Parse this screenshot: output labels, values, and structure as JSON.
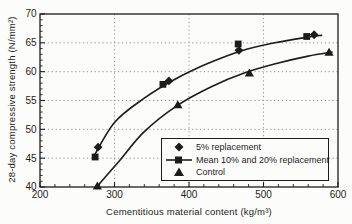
{
  "chart_data": {
    "type": "scatter",
    "title": "",
    "xlabel": "Cementitious material content (kg/m³)",
    "ylabel": "28-day compressive strength (N/mm²)",
    "xlim": [
      200,
      600
    ],
    "ylim": [
      40,
      70
    ],
    "x_ticks": [
      200,
      300,
      400,
      500,
      600
    ],
    "y_ticks": [
      40,
      45,
      50,
      55,
      60,
      65,
      70
    ],
    "x_minor_step": 20,
    "y_minor_step": 1,
    "grid": "dotted",
    "legend_position": "inside-bottom-right",
    "series": [
      {
        "name": "5% replacement",
        "marker": "diamond",
        "points": [
          [
            278,
            46.9
          ],
          [
            373,
            58.4
          ],
          [
            467,
            63.7
          ],
          [
            568,
            66.4
          ]
        ]
      },
      {
        "name": "Mean 10% and 20% replacement",
        "marker": "square",
        "legend_line": true,
        "points": [
          [
            274,
            45.2
          ],
          [
            365,
            57.8
          ],
          [
            466,
            64.8
          ],
          [
            558,
            66.1
          ]
        ]
      },
      {
        "name": "Control",
        "marker": "triangle",
        "points": [
          [
            277,
            40.2
          ],
          [
            385,
            54.3
          ],
          [
            481,
            59.8
          ],
          [
            588,
            63.4
          ]
        ]
      }
    ],
    "fit_curves": [
      {
        "name": "replacement-mean-fit",
        "points": [
          [
            271,
            45.0
          ],
          [
            300,
            51.2
          ],
          [
            340,
            55.4
          ],
          [
            380,
            58.6
          ],
          [
            425,
            61.4
          ],
          [
            470,
            63.6
          ],
          [
            515,
            65.0
          ],
          [
            560,
            66.0
          ],
          [
            578,
            66.3
          ]
        ]
      },
      {
        "name": "control-fit",
        "points": [
          [
            276,
            40.0
          ],
          [
            305,
            44.3
          ],
          [
            340,
            49.6
          ],
          [
            385,
            54.2
          ],
          [
            430,
            57.4
          ],
          [
            475,
            59.8
          ],
          [
            520,
            61.5
          ],
          [
            560,
            62.7
          ],
          [
            592,
            63.4
          ]
        ]
      }
    ],
    "colors": {
      "ink": "#1c1c1c",
      "grid": "#8f8f8f",
      "background": "#fcfcfa"
    }
  }
}
